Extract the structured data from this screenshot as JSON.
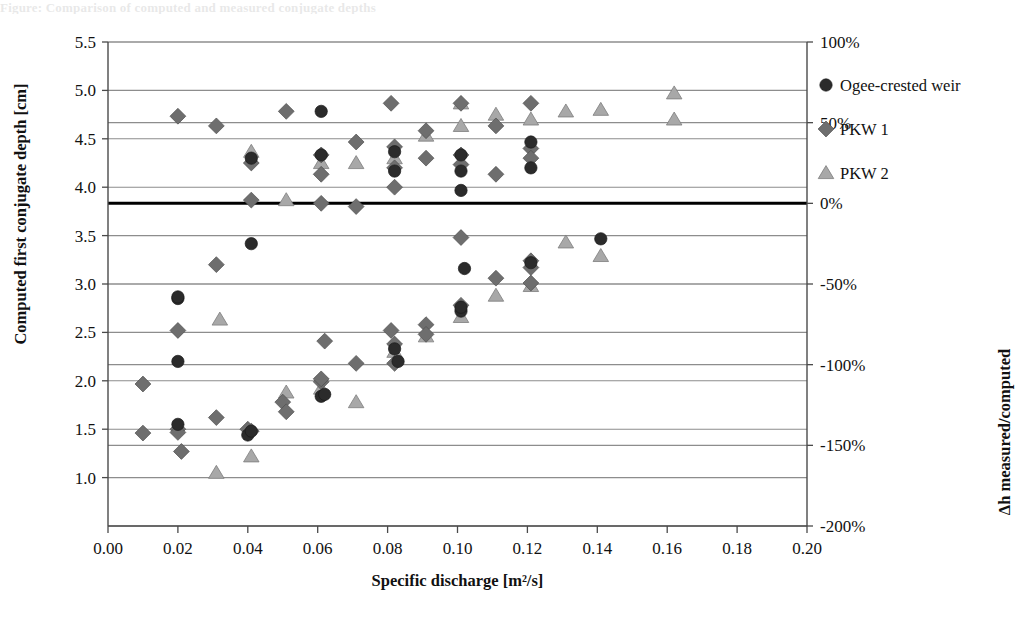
{
  "figure": {
    "top_remnant_text": "Figure:  Comparison of computed and measured conjugate depths"
  },
  "chart_data": {
    "type": "scatter",
    "title": "",
    "xlabel": "Specific discharge [m²/s]",
    "ylabel": "Computed first conjugate depth [cm]",
    "y2label": "Δh measured/computed",
    "xlim": [
      0.0,
      0.2
    ],
    "ylim": [
      0.5,
      5.5
    ],
    "y2lim": [
      -200,
      100
    ],
    "xticks": [
      0.0,
      0.02,
      0.04,
      0.06,
      0.08,
      0.1,
      0.12,
      0.14,
      0.16,
      0.18,
      0.2
    ],
    "xticklabels": [
      "0.00",
      "0.02",
      "0.04",
      "0.06",
      "0.08",
      "0.10",
      "0.12",
      "0.14",
      "0.16",
      "0.18",
      "0.20"
    ],
    "yticks": [
      1.0,
      1.5,
      2.0,
      2.5,
      3.0,
      3.5,
      4.0,
      4.5,
      5.0,
      5.5
    ],
    "yticklabels": [
      "1.0",
      "1.5",
      "2.0",
      "2.5",
      "3.0",
      "3.5",
      "4.0",
      "4.5",
      "5.0",
      "5.5"
    ],
    "y2ticks": [
      100,
      50,
      0,
      -50,
      -100,
      -150,
      -200
    ],
    "y2ticklabels": [
      "100%",
      "50%",
      "0%",
      "-50%",
      "-100%",
      "-150%",
      "-200%"
    ],
    "grid": "horizontal",
    "zero_line": {
      "value": 0,
      "axis": "y2",
      "color": "#000000",
      "width": 3
    },
    "legend": {
      "position": "right",
      "entries": [
        "Ogee-crested weir",
        "PKW 1",
        "PKW 2"
      ]
    },
    "series": [
      {
        "name": "Ogee-crested weir",
        "marker": "circle",
        "color": "#2b2b2b",
        "axis": "y",
        "points": [
          [
            0.02,
            2.85
          ],
          [
            0.02,
            2.2
          ],
          [
            0.04,
            1.44
          ],
          [
            0.041,
            1.48
          ],
          [
            0.061,
            1.84
          ],
          [
            0.062,
            1.86
          ],
          [
            0.082,
            2.33
          ],
          [
            0.083,
            2.2
          ],
          [
            0.101,
            2.72
          ],
          [
            0.101,
            2.76
          ],
          [
            0.102,
            3.16
          ],
          [
            0.121,
            3.22
          ]
        ]
      },
      {
        "name": "Ogee-crested weir",
        "marker": "circle",
        "color": "#2b2b2b",
        "axis": "y2",
        "points": [
          [
            0.02,
            -58
          ],
          [
            0.02,
            -137
          ],
          [
            0.041,
            28
          ],
          [
            0.041,
            -25
          ],
          [
            0.061,
            57
          ],
          [
            0.061,
            30
          ],
          [
            0.082,
            32
          ],
          [
            0.082,
            20
          ],
          [
            0.101,
            30
          ],
          [
            0.101,
            20
          ],
          [
            0.101,
            8
          ],
          [
            0.121,
            38
          ],
          [
            0.121,
            22
          ],
          [
            0.141,
            -22
          ]
        ]
      },
      {
        "name": "PKW 1",
        "marker": "diamond",
        "color": "#6e6e6e",
        "axis": "y",
        "points": [
          [
            0.01,
            1.46
          ],
          [
            0.02,
            1.5
          ],
          [
            0.02,
            2.52
          ],
          [
            0.021,
            1.27
          ],
          [
            0.031,
            1.62
          ],
          [
            0.04,
            1.5
          ],
          [
            0.041,
            1.48
          ],
          [
            0.05,
            1.78
          ],
          [
            0.051,
            1.68
          ],
          [
            0.061,
            1.99
          ],
          [
            0.061,
            2.02
          ],
          [
            0.062,
            2.41
          ],
          [
            0.071,
            2.18
          ],
          [
            0.081,
            2.52
          ],
          [
            0.082,
            2.38
          ],
          [
            0.082,
            2.18
          ],
          [
            0.091,
            2.58
          ],
          [
            0.091,
            2.48
          ],
          [
            0.101,
            3.48
          ],
          [
            0.101,
            2.78
          ],
          [
            0.111,
            3.06
          ],
          [
            0.121,
            3.24
          ],
          [
            0.121,
            3.17
          ],
          [
            0.121,
            3.01
          ]
        ]
      },
      {
        "name": "PKW 1",
        "marker": "diamond",
        "color": "#6e6e6e",
        "axis": "y2",
        "points": [
          [
            0.01,
            -112
          ],
          [
            0.02,
            54
          ],
          [
            0.02,
            -142
          ],
          [
            0.031,
            48
          ],
          [
            0.031,
            -38
          ],
          [
            0.041,
            2
          ],
          [
            0.041,
            25
          ],
          [
            0.051,
            57
          ],
          [
            0.061,
            18
          ],
          [
            0.061,
            0
          ],
          [
            0.061,
            30
          ],
          [
            0.071,
            38
          ],
          [
            0.071,
            -2
          ],
          [
            0.081,
            62
          ],
          [
            0.082,
            35
          ],
          [
            0.082,
            22
          ],
          [
            0.082,
            10
          ],
          [
            0.091,
            45
          ],
          [
            0.091,
            28
          ],
          [
            0.101,
            62
          ],
          [
            0.101,
            30
          ],
          [
            0.101,
            24
          ],
          [
            0.111,
            48
          ],
          [
            0.111,
            18
          ],
          [
            0.121,
            62
          ],
          [
            0.121,
            34
          ],
          [
            0.121,
            28
          ]
        ]
      },
      {
        "name": "PKW 2",
        "marker": "triangle",
        "color": "#a8a8a8",
        "axis": "y",
        "points": [
          [
            0.031,
            1.05
          ],
          [
            0.041,
            1.22
          ],
          [
            0.051,
            1.88
          ],
          [
            0.061,
            1.92
          ],
          [
            0.071,
            1.78
          ],
          [
            0.082,
            2.3
          ],
          [
            0.091,
            2.46
          ],
          [
            0.101,
            2.66
          ],
          [
            0.111,
            2.88
          ],
          [
            0.121,
            2.98
          ],
          [
            0.131,
            3.43
          ],
          [
            0.141,
            3.29
          ],
          [
            0.162,
            4.97
          ]
        ]
      },
      {
        "name": "PKW 2",
        "marker": "triangle",
        "color": "#a8a8a8",
        "axis": "y2",
        "points": [
          [
            0.032,
            -72
          ],
          [
            0.041,
            32
          ],
          [
            0.051,
            2
          ],
          [
            0.061,
            25
          ],
          [
            0.071,
            25
          ],
          [
            0.082,
            28
          ],
          [
            0.091,
            42
          ],
          [
            0.101,
            62
          ],
          [
            0.101,
            48
          ],
          [
            0.111,
            55
          ],
          [
            0.121,
            52
          ],
          [
            0.131,
            57
          ],
          [
            0.141,
            58
          ],
          [
            0.162,
            52
          ]
        ]
      }
    ]
  }
}
